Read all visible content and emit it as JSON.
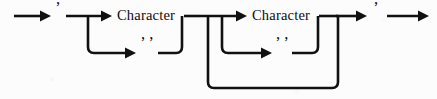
{
  "diagram": {
    "kind": "railroad-syntax-diagram",
    "background_color": "#fcfcfc",
    "line_color": "#111111",
    "text_color": "#0d0d0d",
    "width": 437,
    "height": 99,
    "main_line_y": 16,
    "branch_line_y": 53,
    "loop_line_y": 88,
    "nodes": {
      "entry_arrow": {
        "name": "entry-arrow",
        "x1": 14,
        "x2": 48,
        "y": 16
      },
      "open_quote": {
        "name": "open-quote",
        "label": "’",
        "x": 57,
        "y": 11
      },
      "first_group": {
        "name": "first-character-group",
        "split_x": 88,
        "merge_x": 182,
        "top_arrow": {
          "x1": 66,
          "x2": 110,
          "y": 16
        },
        "term": {
          "name": "character-terminal-1",
          "label": "Character",
          "x": 145,
          "y": 16
        },
        "term_out": {
          "x1": 182,
          "x2": 198,
          "y": 16
        },
        "alt_arrow": {
          "x1": 88,
          "x2": 134,
          "y": 53
        },
        "alt_label": {
          "name": "escaped-quote-pair-1",
          "label": "’ ’",
          "x": 146,
          "y": 47
        },
        "alt_out": {
          "x1": 158,
          "x2": 182,
          "y": 53
        }
      },
      "second_group": {
        "name": "second-character-group",
        "split_x": 222,
        "merge_x": 318,
        "top_arrow": {
          "x1": 200,
          "x2": 246,
          "y": 16
        },
        "term": {
          "name": "character-terminal-2",
          "label": "Character",
          "x": 280,
          "y": 16
        },
        "term_out": {
          "x1": 318,
          "x2": 336,
          "y": 16
        },
        "alt_arrow": {
          "x1": 222,
          "x2": 270,
          "y": 53
        },
        "alt_label": {
          "name": "escaped-quote-pair-2",
          "label": "’ ’",
          "x": 281,
          "y": 47
        },
        "alt_out": {
          "x1": 292,
          "x2": 318,
          "y": 53
        }
      },
      "repeat_loop": {
        "name": "repeat-loop",
        "left_x": 208,
        "right_x": 338,
        "top_y": 16,
        "bottom_y": 88
      },
      "exit_to_quote_arrow": {
        "name": "exit-arrow",
        "x1": 336,
        "x2": 366,
        "y": 16
      },
      "close_quote": {
        "name": "close-quote",
        "label": "’",
        "x": 375,
        "y": 11
      },
      "final_arrow": {
        "name": "final-arrow",
        "x1": 387,
        "x2": 428,
        "y": 16
      }
    },
    "labels": {
      "character_1": "Character",
      "character_2": "Character",
      "quote_open": "’",
      "quote_close": "’",
      "quote_pair_1": "’ ’",
      "quote_pair_2": "’ ’"
    }
  }
}
